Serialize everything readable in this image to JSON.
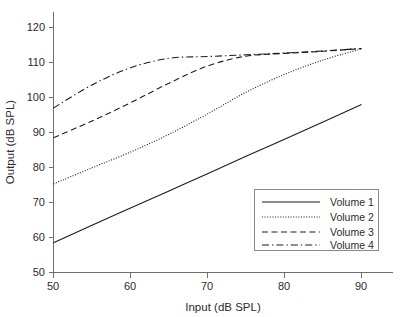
{
  "chart_data": {
    "type": "line",
    "title": "",
    "xlabel": "Input (dB SPL)",
    "ylabel": "Output (dB SPL)",
    "xlim": [
      50,
      90
    ],
    "ylim": [
      50,
      120
    ],
    "xticks": [
      50,
      60,
      70,
      80,
      90
    ],
    "yticks": [
      50,
      60,
      70,
      80,
      90,
      100,
      110,
      120
    ],
    "grid": false,
    "legend_position": "lower-right",
    "x": [
      50,
      55,
      60,
      65,
      70,
      75,
      80,
      85,
      90
    ],
    "series": [
      {
        "name": "Volume 1",
        "style": "solid",
        "values": [
          58.5,
          63.5,
          68.4,
          73.3,
          78.2,
          83.2,
          88.1,
          93.0,
          98.0
        ]
      },
      {
        "name": "Volume 2",
        "style": "dotted",
        "values": [
          75.3,
          79.9,
          84.4,
          89.5,
          95.3,
          101.5,
          106.6,
          110.7,
          113.9
        ]
      },
      {
        "name": "Volume 3",
        "style": "dashed",
        "values": [
          88.5,
          93.3,
          98.5,
          104.1,
          109.0,
          111.8,
          112.6,
          113.2,
          114.0
        ]
      },
      {
        "name": "Volume 4",
        "style": "dash-dot",
        "values": [
          97.0,
          103.6,
          108.5,
          111.2,
          111.7,
          112.2,
          112.7,
          113.3,
          114.0
        ]
      }
    ]
  },
  "axes": {
    "x_tick_labels": [
      "50",
      "60",
      "70",
      "80",
      "90"
    ],
    "y_tick_labels": [
      "50",
      "60",
      "70",
      "80",
      "90",
      "100",
      "110",
      "120"
    ],
    "x_axis_title": "Input (dB SPL)",
    "y_axis_title": "Output (dB SPL)"
  },
  "legend": {
    "entries": [
      {
        "label": "Volume 1",
        "style": "solid"
      },
      {
        "label": "Volume 2",
        "style": "dotted"
      },
      {
        "label": "Volume 3",
        "style": "dashed"
      },
      {
        "label": "Volume 4",
        "style": "dash-dot"
      }
    ]
  },
  "colors": {
    "background": "#ffffff",
    "axis": "#6e6e6e",
    "series": "#1c1c1c",
    "text": "#2b2b2b",
    "legend_border": "#8a8a8a"
  }
}
